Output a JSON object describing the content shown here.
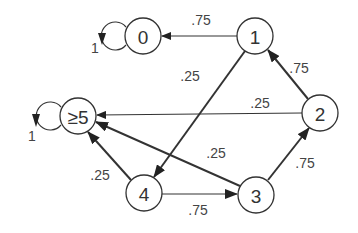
{
  "diagram": {
    "type": "state-transition-graph",
    "colors": {
      "stroke": "#333333",
      "text": "#333333",
      "label": "#444444",
      "background": "#ffffff"
    },
    "nodes": [
      {
        "id": "0",
        "label": "0",
        "x": 143,
        "y": 36
      },
      {
        "id": "1",
        "label": "1",
        "x": 255,
        "y": 36
      },
      {
        "id": "2",
        "label": "2",
        "x": 320,
        "y": 113
      },
      {
        "id": "3",
        "label": "3",
        "x": 256,
        "y": 195
      },
      {
        "id": "4",
        "label": "4",
        "x": 144,
        "y": 193
      },
      {
        "id": "5plus",
        "label": "≥5",
        "x": 78,
        "y": 116
      }
    ],
    "edges": [
      {
        "from": "1",
        "to": "0",
        "label": ".75"
      },
      {
        "from": "1",
        "to": "4",
        "label": ".25"
      },
      {
        "from": "2",
        "to": "1",
        "label": ".75"
      },
      {
        "from": "2",
        "to": "5plus",
        "label": ".25"
      },
      {
        "from": "3",
        "to": "2",
        "label": ".75"
      },
      {
        "from": "3",
        "to": "5plus",
        "label": ".25"
      },
      {
        "from": "4",
        "to": "3",
        "label": ".75"
      },
      {
        "from": "4",
        "to": "5plus",
        "label": ".25"
      }
    ],
    "self_loops": [
      {
        "node": "0",
        "label": "1"
      },
      {
        "node": "5plus",
        "label": "1"
      }
    ]
  }
}
